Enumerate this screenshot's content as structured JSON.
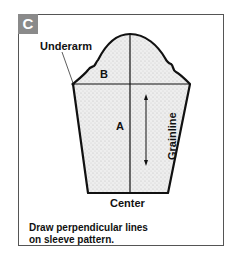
{
  "badge": {
    "label": "C",
    "color": "#8a8a8a"
  },
  "labels": {
    "underarm": "Underarm",
    "b": "B",
    "a": "A",
    "grainline": "Grainline",
    "center": "Center"
  },
  "caption": {
    "line1": "Draw perpendicular lines",
    "line2": "on sleeve pattern."
  },
  "colors": {
    "outline": "#111111",
    "fill": "#e6e6e6",
    "frame": "#555555"
  }
}
